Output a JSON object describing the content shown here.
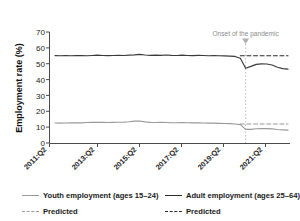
{
  "chart_data": {
    "type": "line",
    "title": "",
    "xlabel": "",
    "ylabel": "Employment rate (%)",
    "ylim": [
      0,
      70
    ],
    "yticks": [
      0,
      10,
      20,
      30,
      40,
      50,
      60,
      70
    ],
    "xtick_labels": [
      "2011:Q2",
      "2013:Q2",
      "2015:Q2",
      "2017:Q2",
      "2019:Q2",
      "2021:Q2"
    ],
    "grid": false,
    "legend_position": "below",
    "annotations": [
      {
        "text": "Onset of the pandemic",
        "x": "2020:Q2",
        "marker": "down-triangle"
      }
    ],
    "event_line": {
      "label": "Onset of the pandemic",
      "x": "2020:Q2",
      "style": "dotted",
      "color": "#b5b5b5"
    },
    "x": [
      "2011:Q2",
      "2011:Q3",
      "2011:Q4",
      "2012:Q1",
      "2012:Q2",
      "2012:Q3",
      "2012:Q4",
      "2013:Q1",
      "2013:Q2",
      "2013:Q3",
      "2013:Q4",
      "2014:Q1",
      "2014:Q2",
      "2014:Q3",
      "2014:Q4",
      "2015:Q1",
      "2015:Q2",
      "2015:Q3",
      "2015:Q4",
      "2016:Q1",
      "2016:Q2",
      "2016:Q3",
      "2016:Q4",
      "2017:Q1",
      "2017:Q2",
      "2017:Q3",
      "2017:Q4",
      "2018:Q1",
      "2018:Q2",
      "2018:Q3",
      "2018:Q4",
      "2019:Q1",
      "2019:Q2",
      "2019:Q3",
      "2019:Q4",
      "2020:Q1",
      "2020:Q2",
      "2020:Q3",
      "2020:Q4",
      "2021:Q1",
      "2021:Q2",
      "2021:Q3",
      "2021:Q4",
      "2022:Q1",
      "2022:Q2"
    ],
    "series": [
      {
        "name": "Adult employment (ages 25–64)",
        "style": "solid",
        "color": "#3a3a3a",
        "values": [
          55.1,
          55.0,
          55.1,
          55.0,
          55.2,
          55.1,
          55.0,
          55.2,
          55.4,
          55.2,
          55.1,
          55.2,
          55.3,
          55.2,
          55.4,
          55.6,
          55.9,
          55.5,
          55.3,
          55.4,
          55.3,
          55.5,
          55.3,
          55.2,
          55.4,
          55.2,
          55.1,
          55.3,
          55.2,
          55.0,
          55.1,
          55.0,
          54.9,
          54.8,
          54.6,
          53.4,
          47.1,
          48.3,
          49.6,
          49.9,
          49.8,
          49.2,
          47.8,
          46.9,
          46.6
        ]
      },
      {
        "name": "Adult employment predicted",
        "style": "dashed",
        "color": "#2b2b2b",
        "values": [
          null,
          null,
          null,
          null,
          null,
          null,
          null,
          null,
          null,
          null,
          null,
          null,
          null,
          null,
          null,
          null,
          null,
          null,
          null,
          null,
          null,
          null,
          null,
          null,
          null,
          null,
          null,
          null,
          null,
          null,
          null,
          null,
          null,
          null,
          null,
          55.0,
          55.0,
          55.0,
          55.0,
          55.0,
          55.0,
          55.0,
          55.0,
          55.0,
          55.0
        ]
      },
      {
        "name": "Youth employment (ages 15–24)",
        "style": "solid",
        "color": "#9a9a9a",
        "values": [
          12.6,
          12.5,
          12.6,
          12.7,
          12.8,
          12.7,
          12.9,
          13.0,
          13.1,
          13.0,
          12.9,
          13.0,
          13.1,
          13.2,
          13.4,
          13.8,
          13.9,
          13.3,
          13.0,
          12.9,
          13.0,
          12.9,
          12.8,
          12.8,
          12.9,
          12.8,
          12.7,
          12.7,
          12.6,
          12.5,
          12.5,
          12.4,
          12.3,
          12.2,
          12.0,
          11.6,
          8.6,
          8.6,
          9.0,
          9.1,
          9.1,
          8.9,
          8.5,
          8.3,
          8.1
        ]
      },
      {
        "name": "Youth employment predicted",
        "style": "dashed",
        "color": "#9a9a9a",
        "values": [
          null,
          null,
          null,
          null,
          null,
          null,
          null,
          null,
          null,
          null,
          null,
          null,
          null,
          null,
          null,
          null,
          null,
          null,
          null,
          null,
          null,
          null,
          null,
          null,
          null,
          null,
          null,
          null,
          null,
          null,
          null,
          null,
          null,
          null,
          null,
          12.0,
          12.0,
          12.0,
          12.0,
          12.0,
          12.0,
          12.0,
          12.0,
          12.0,
          12.0
        ]
      }
    ]
  },
  "legend": {
    "entries": [
      {
        "label": "Youth employment (ages 15–24)",
        "style": "solid",
        "tone": "light"
      },
      {
        "label": "Adult employment (ages 25–64)",
        "style": "solid",
        "tone": "dark"
      },
      {
        "label": "Predicted",
        "style": "dashed",
        "tone": "light"
      },
      {
        "label": "Predicted",
        "style": "dashed",
        "tone": "dark"
      }
    ]
  },
  "colors": {
    "youth": "#9a9a9a",
    "adult": "#3a3a3a",
    "axis": "#4a4a4a",
    "annotation": "#8c8c8c"
  }
}
